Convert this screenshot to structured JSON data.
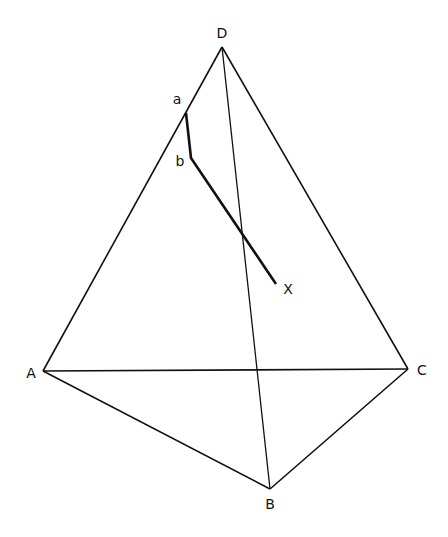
{
  "diagram": {
    "type": "tetrahedron",
    "colors": {
      "background": "#ffffff",
      "line": "#111111"
    },
    "vertices": {
      "D": {
        "label": "D",
        "x": 222,
        "y": 47,
        "lx": 222,
        "ly": 38
      },
      "A": {
        "label": "A",
        "x": 43,
        "y": 371,
        "lx": 31,
        "ly": 378
      },
      "C": {
        "label": "C",
        "x": 408,
        "y": 369,
        "lx": 422,
        "ly": 375
      },
      "B": {
        "label": "B",
        "x": 270,
        "y": 489,
        "lx": 270,
        "ly": 509
      }
    },
    "path_points": {
      "a": {
        "label": "a",
        "x": 186,
        "y": 113,
        "lx": 177,
        "ly": 104
      },
      "b": {
        "label": "b",
        "x": 191,
        "y": 158,
        "lx": 180,
        "ly": 166
      },
      "X": {
        "label": "X",
        "x": 276,
        "y": 284,
        "lx": 288,
        "ly": 294
      }
    }
  }
}
